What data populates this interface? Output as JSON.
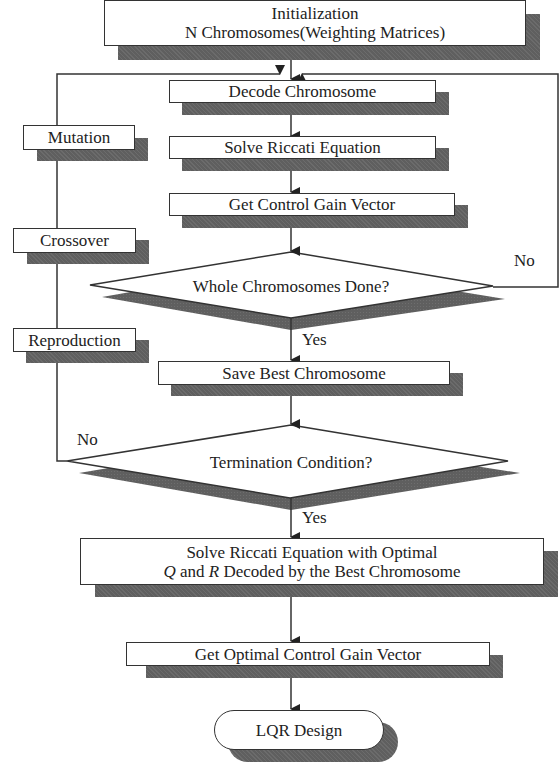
{
  "diagram": {
    "nodes": {
      "init": {
        "line1": "Initialization",
        "line2": "N Chromosomes(Weighting Matrices)"
      },
      "decode": {
        "label": "Decode Chromosome"
      },
      "solve_riccati": {
        "label": "Solve Riccati Equation"
      },
      "get_gain": {
        "label": "Get Control Gain Vector"
      },
      "whole_done": {
        "label": "Whole Chromosomes Done?"
      },
      "save_best": {
        "label": "Save Best Chromosome"
      },
      "termination": {
        "label": "Termination Condition?"
      },
      "solve_final": {
        "line1": "Solve Riccati Equation with Optimal",
        "line2_q": "Q",
        "line2_and": " and ",
        "line2_r": "R",
        "line2_rest": " Decoded by the Best Chromosome"
      },
      "get_optimal_gain": {
        "label": "Get Optimal Control Gain Vector"
      },
      "lqr_design": {
        "label": "LQR Design"
      },
      "mutation": {
        "label": "Mutation"
      },
      "crossover": {
        "label": "Crossover"
      },
      "reproduction": {
        "label": "Reproduction"
      }
    },
    "edge_labels": {
      "whole_no": "No",
      "whole_yes": "Yes",
      "term_no": "No",
      "term_yes": "Yes"
    },
    "colors": {
      "line": "#333333",
      "shadow": "#5f5f5f",
      "fill": "#ffffff"
    }
  }
}
